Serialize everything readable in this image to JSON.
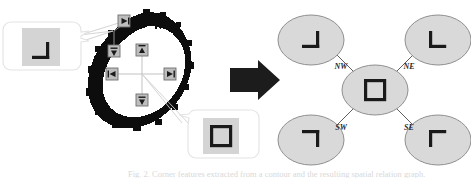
{
  "figure": {
    "caption_partial": "Fig. 2.  Corner features extracted from a contour and the resulting spatial relation graph.",
    "background_color": "#ffffff",
    "ink_color": "#1a1a1a",
    "blob_color": "#0d0d0d",
    "ellipse_fill": "#d9d9d9",
    "ellipse_stroke": "#8c8c8c",
    "callout_fill": "#ffffff",
    "callout_stroke": "#e2e2e2",
    "patch_fill": "#d4d4d4",
    "handle_fill": "#bdbdbd",
    "handle_stroke": "#7a7a7a",
    "leader_color": "#c9c9c9"
  },
  "left_panel": {
    "name": "contour-with-corner-handles",
    "blob_label": "contour blob",
    "handles": [
      {
        "id": "handle-ne",
        "glyph": "right-triangle-marker",
        "direction": "NE"
      },
      {
        "id": "handle-nw",
        "glyph": "down-triangle-marker",
        "direction": "NW"
      },
      {
        "id": "handle-n",
        "glyph": "up-triangle-marker",
        "direction": "N"
      },
      {
        "id": "handle-w",
        "glyph": "left-triangle-marker",
        "direction": "W"
      },
      {
        "id": "handle-e",
        "glyph": "right-triangle-marker",
        "direction": "E"
      },
      {
        "id": "handle-s",
        "glyph": "down-triangle-marker",
        "direction": "S"
      }
    ],
    "callouts": [
      {
        "id": "callout-corner-patch",
        "position": "upper-left",
        "patch_label": "corner patch",
        "corner_glyph": "corner-bottom-right"
      },
      {
        "id": "callout-square-patch",
        "position": "lower-right",
        "patch_label": "square patch",
        "corner_glyph": "square-outline"
      }
    ]
  },
  "arrow": {
    "name": "transform-arrow",
    "glyph": "arrow-right",
    "label": ""
  },
  "right_panel": {
    "name": "spatial-relation-graph",
    "center_node": {
      "id": "node-center",
      "glyph": "square-outline",
      "label": ""
    },
    "nodes": [
      {
        "id": "node-nw",
        "glyph": "corner-bottom-right",
        "edge_label": "NW"
      },
      {
        "id": "node-ne",
        "glyph": "corner-bottom-left",
        "edge_label": "NE"
      },
      {
        "id": "node-sw",
        "glyph": "corner-top-right",
        "edge_label": "SW"
      },
      {
        "id": "node-se",
        "glyph": "corner-top-left",
        "edge_label": "SE"
      }
    ],
    "edge_labels": [
      "NW",
      "NE",
      "SW",
      "SE"
    ]
  }
}
